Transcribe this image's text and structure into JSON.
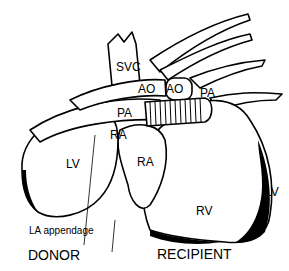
{
  "figure": {
    "colors": {
      "ink": "#000000",
      "background": "#ffffff"
    },
    "labels": {
      "svc": "SVC",
      "ao_donor": "AO",
      "ao_recipient": "AO",
      "pa_recipient": "PA",
      "pa_donor": "PA",
      "ra_donor": "RA",
      "lv_donor": "LV",
      "ra_recipient": "RA",
      "rv_recipient": "RV",
      "lv_recipient": "LV",
      "la_appendage": "LA  appendage",
      "donor": "DONOR",
      "recipient": "RECIPIENT"
    }
  }
}
